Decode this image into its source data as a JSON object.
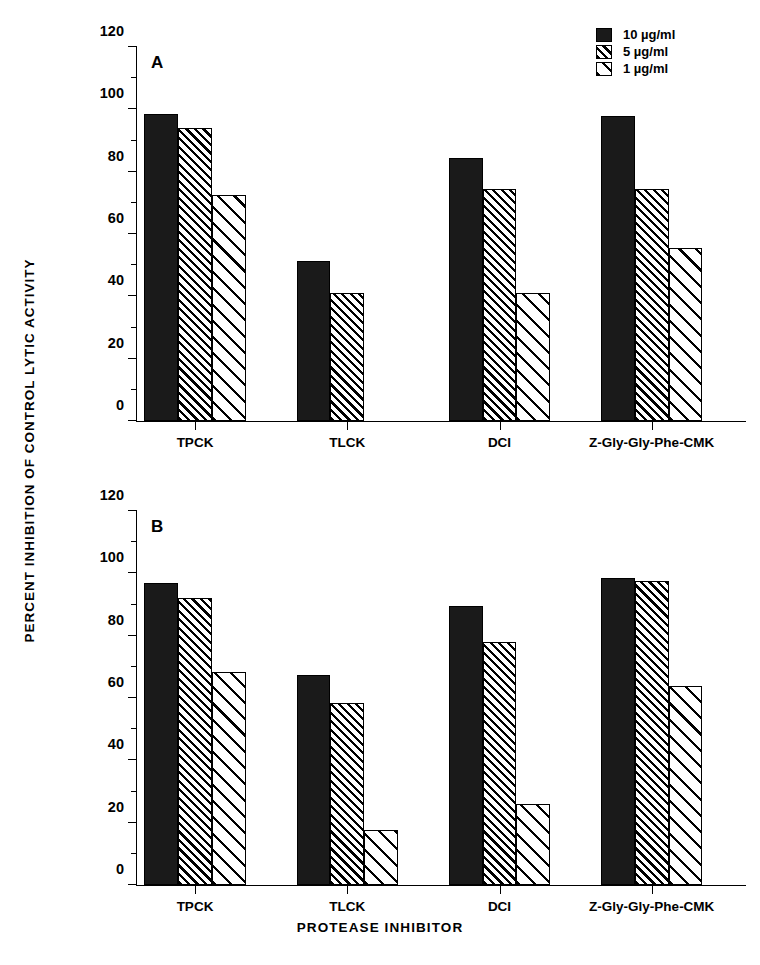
{
  "chart_data": {
    "type": "bar",
    "title": "",
    "xlabel": "PROTEASE INHIBITOR",
    "ylabel": "PERCENT INHIBITION OF CONTROL LYTIC ACTIVITY",
    "ylim": [
      0,
      120
    ],
    "yticks": [
      0,
      20,
      40,
      60,
      80,
      100,
      120
    ],
    "ytick_minor": [
      10,
      30,
      50,
      70,
      90,
      110
    ],
    "grid": false,
    "legend_position": "top-right",
    "categories": [
      "TPCK",
      "TLCK",
      "DCI",
      "Z-Gly-Gly-Phe-CMK"
    ],
    "legend": [
      "10 µg/ml",
      "5 µg/ml",
      "1 µg/ml"
    ],
    "panels": [
      {
        "letter": "A",
        "series": [
          {
            "name": "10 µg/ml",
            "fill": "solid",
            "values": [
              98.5,
              51.5,
              84.5,
              98.0
            ]
          },
          {
            "name": "5 µg/ml",
            "fill": "dense",
            "values": [
              94.0,
              41.0,
              74.5,
              74.5
            ]
          },
          {
            "name": "1 µg/ml",
            "fill": "sparse",
            "values": [
              72.5,
              null,
              41.0,
              55.5
            ]
          }
        ]
      },
      {
        "letter": "B",
        "series": [
          {
            "name": "10 µg/ml",
            "fill": "solid",
            "values": [
              97.0,
              67.5,
              89.5,
              98.5
            ]
          },
          {
            "name": "5 µg/ml",
            "fill": "dense",
            "values": [
              92.0,
              58.5,
              78.0,
              97.5
            ]
          },
          {
            "name": "1 µg/ml",
            "fill": "sparse",
            "values": [
              68.5,
              17.5,
              26.0,
              64.0
            ]
          }
        ]
      }
    ]
  }
}
